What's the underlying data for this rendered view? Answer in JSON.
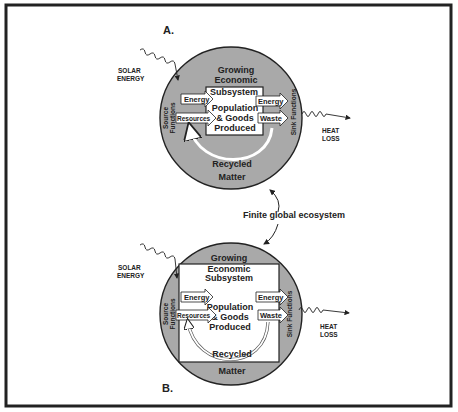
{
  "diagram": {
    "panel_a": {
      "label": "A.",
      "subsystem_lines": [
        "Growing",
        "Economic",
        "Subsystem"
      ],
      "center_lines": [
        "Population",
        "& Goods",
        "Produced"
      ],
      "inputs": [
        "Energy",
        "Resources"
      ],
      "outputs": [
        "Energy",
        "Waste"
      ],
      "recycled_lines": [
        "Recycled",
        "Matter"
      ],
      "source_lines": [
        "Source",
        "Functions"
      ],
      "sink_label": "Sink Functions",
      "solar_lines": [
        "SOLAR",
        "ENERGY"
      ],
      "heat_lines": [
        "HEAT",
        "LOSS"
      ]
    },
    "panel_b": {
      "label": "B.",
      "subsystem_lines": [
        "Growing",
        "Economic",
        "Subsystem"
      ],
      "center_lines": [
        "Population",
        "& Goods",
        "Produced"
      ],
      "inputs": [
        "Energy",
        "Resources"
      ],
      "outputs": [
        "Energy",
        "Waste"
      ],
      "recycled_lines": [
        "Recycled",
        "Matter"
      ],
      "source_lines": [
        "Source",
        "Functions"
      ],
      "sink_label": "Sink Functions",
      "solar_lines": [
        "SOLAR",
        "ENERGY"
      ],
      "heat_lines": [
        "HEAT",
        "LOSS"
      ]
    },
    "center_label": "Finite global ecosystem",
    "colors": {
      "ecosystem_fill": "#a9a9a9",
      "outline": "#222222",
      "box_fill": "#ffffff",
      "frame": "#222222"
    }
  }
}
